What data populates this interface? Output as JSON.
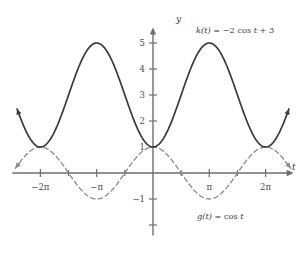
{
  "figure": {
    "title": "",
    "axis_labels": {
      "x": "t",
      "y": "y"
    },
    "origin_px": {
      "x": 153,
      "y": 173
    },
    "scale_px": {
      "pi": 56.3,
      "unit_y": 26
    },
    "colors": {
      "axis": "#6e6e6e",
      "solid_curve": "#3a3a3a",
      "dashed_curve": "#8a8a8a",
      "text": "#3a3a3a",
      "background": "#ffffff"
    },
    "x_ticks": [
      {
        "value": -6.2832,
        "label": "−2π"
      },
      {
        "value": -3.1416,
        "label": "−π"
      },
      {
        "value": 3.1416,
        "label": "π"
      },
      {
        "value": 6.2832,
        "label": "2π"
      }
    ],
    "x_minor_ticks": [
      -4.7124,
      -1.5708,
      1.5708,
      4.7124
    ],
    "y_ticks": [
      {
        "value": 5,
        "label": "5"
      },
      {
        "value": 4,
        "label": "4"
      },
      {
        "value": 3,
        "label": "3"
      },
      {
        "value": 2,
        "label": "2"
      },
      {
        "value": 1,
        "label": "1"
      },
      {
        "value": -1,
        "label": "−1"
      },
      {
        "value": -2,
        "label": ""
      }
    ],
    "labels": {
      "k_label": "k(t) = −2 cos t + 3",
      "k_label_parts": {
        "name": "k",
        "arg": "(t)",
        "eq": " = −2 cos ",
        "var": "t",
        "tail": " + 3"
      },
      "g_label": "g(t) = cos t",
      "g_label_parts": {
        "name": "g",
        "arg": "(t)",
        "eq": " = cos ",
        "var": "t"
      }
    }
  },
  "chart_data": {
    "type": "line",
    "title": "",
    "xlabel": "t",
    "ylabel": "y",
    "xlim": [
      -7.85,
      7.85
    ],
    "ylim": [
      -2.4,
      5.6
    ],
    "grid": false,
    "legend": "inline-annotations",
    "x_tick_values": [
      -6.2832,
      -3.1416,
      0,
      3.1416,
      6.2832
    ],
    "x_tick_labels": [
      "−2π",
      "−π",
      "",
      "π",
      "2π"
    ],
    "y_tick_values": [
      5,
      4,
      3,
      2,
      1,
      -1,
      -2
    ],
    "y_tick_labels": [
      "5",
      "4",
      "3",
      "2",
      "1",
      "−1",
      ""
    ],
    "series": [
      {
        "name": "k(t) = −2 cos t + 3",
        "style": "solid",
        "color": "#3a3a3a",
        "formula": "-2*cos(t)+3",
        "amplitude": 2,
        "vertical_shift": 3,
        "period": 6.2832,
        "minimum": 1,
        "maximum": 5,
        "minima_at": [
          -6.2832,
          0,
          6.2832
        ],
        "maxima_at": [
          -3.1416,
          3.1416
        ],
        "key_points": [
          {
            "t": -6.2832,
            "y": 1
          },
          {
            "t": -4.7124,
            "y": 3
          },
          {
            "t": -3.1416,
            "y": 5
          },
          {
            "t": -1.5708,
            "y": 3
          },
          {
            "t": 0,
            "y": 1
          },
          {
            "t": 1.5708,
            "y": 3
          },
          {
            "t": 3.1416,
            "y": 5
          },
          {
            "t": 4.7124,
            "y": 3
          },
          {
            "t": 6.2832,
            "y": 1
          }
        ]
      },
      {
        "name": "g(t) = cos t",
        "style": "dashed",
        "color": "#8a8a8a",
        "formula": "cos(t)",
        "amplitude": 1,
        "vertical_shift": 0,
        "period": 6.2832,
        "minimum": -1,
        "maximum": 1,
        "minima_at": [
          -3.1416,
          3.1416
        ],
        "maxima_at": [
          -6.2832,
          0,
          6.2832
        ],
        "key_points": [
          {
            "t": -6.2832,
            "y": 1
          },
          {
            "t": -4.7124,
            "y": 0
          },
          {
            "t": -3.1416,
            "y": -1
          },
          {
            "t": -1.5708,
            "y": 0
          },
          {
            "t": 0,
            "y": 1
          },
          {
            "t": 1.5708,
            "y": 0
          },
          {
            "t": 3.1416,
            "y": -1
          },
          {
            "t": 4.7124,
            "y": 0
          },
          {
            "t": 6.2832,
            "y": 1
          }
        ]
      }
    ],
    "annotations": [
      {
        "text": "k(t) = −2 cos t + 3",
        "t": 5.0,
        "y": 5.35
      },
      {
        "text": "g(t) = cos t",
        "t": 4.6,
        "y": -1.55
      }
    ]
  }
}
